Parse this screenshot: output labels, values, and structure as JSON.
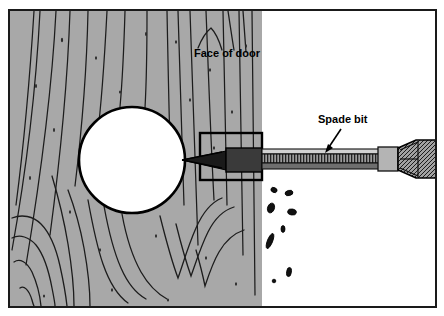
{
  "figure": {
    "domain": "technical-illustration",
    "width": 444,
    "height": 316,
    "background_color": "#ffffff",
    "border_color": "#1a1a1a"
  },
  "labels": [
    {
      "id": "face-of-door",
      "text": "Face of door",
      "x": 194,
      "y": 57,
      "anchor": "start",
      "font_size": 11,
      "bold": true,
      "color": "#000000"
    },
    {
      "id": "spade-bit",
      "text": "Spade bit",
      "x": 318,
      "y": 123,
      "anchor": "start",
      "font_size": 11,
      "bold": true,
      "color": "#000000"
    }
  ],
  "annotations": {
    "spade_bit_arrow": {
      "name": "spade-bit-leader-arrow",
      "from_x": 341,
      "from_y": 129,
      "to_x": 325,
      "to_y": 153,
      "stroke_width": 1.6,
      "color": "#000000"
    }
  },
  "colors": {
    "wood_fill": "#a8a8a8",
    "wood_grain_line": "#1a1a1a",
    "hole_fill": "#ffffff",
    "outline": "#000000",
    "bit_shaft_light": "#c9c9c9",
    "bit_shaft_mid": "#8a8a8a",
    "bit_shaft_dark": "#2b2b2b",
    "chuck_fill": "#9a9a9a",
    "chip_fill": "#111111",
    "air_background": "#ffffff"
  },
  "geometry": {
    "frame": {
      "x": 8,
      "y": 9,
      "width": 428,
      "height": 299,
      "stroke_width": 2
    },
    "wood_panel": {
      "x": 10,
      "y": 11,
      "width": 252,
      "height": 295
    },
    "door_face_edge_x": 262,
    "hole": {
      "cx": 132,
      "cy": 160,
      "r": 53
    },
    "kerf_box": {
      "x": 200,
      "y": 133,
      "width": 62,
      "height": 47
    },
    "bit_tip_apex": {
      "x": 182,
      "y": 160
    },
    "shaft": {
      "x": 262,
      "y": 149,
      "width": 135,
      "height": 20
    },
    "chuck": {
      "x": 397,
      "y": 140,
      "width": 39,
      "height": 38
    }
  },
  "chips": [
    {
      "cx": 274,
      "cy": 190,
      "rx": 3.2,
      "ry": 2.4,
      "rot": 25
    },
    {
      "cx": 288,
      "cy": 193,
      "rx": 4.0,
      "ry": 2.6,
      "rot": -15
    },
    {
      "cx": 271,
      "cy": 208,
      "rx": 3.6,
      "ry": 5.0,
      "rot": 20
    },
    {
      "cx": 292,
      "cy": 212,
      "rx": 4.4,
      "ry": 3.0,
      "rot": 10
    },
    {
      "cx": 282,
      "cy": 229,
      "rx": 2.0,
      "ry": 3.4,
      "rot": 0
    },
    {
      "cx": 270,
      "cy": 240,
      "rx": 2.6,
      "ry": 8.0,
      "rot": 22
    },
    {
      "cx": 289,
      "cy": 272,
      "rx": 2.4,
      "ry": 4.6,
      "rot": 8
    },
    {
      "cx": 274,
      "cy": 281,
      "rx": 1.8,
      "ry": 1.8,
      "rot": 0
    }
  ],
  "wood_grain_strokes": [
    "M 34 11 C 30 60, 26 120, 18 200",
    "M 52 11 C 48 70, 40 140, 22 260",
    "M 68 11 C 66 70, 60 140, 48 230",
    "M 88 11 C 86 60, 82 120, 74 185",
    "M 106 11 C 104 50, 101 100, 96 140",
    "M 124 11 C 123 45, 121 85, 119 107",
    "M 146 11 C 146 50, 145 90, 144 108",
    "M 166 11 C 167 60, 168 120, 170 175",
    "M 186 11 C 188 70, 190 140, 194 230",
    "M 204 11 C 206 60, 208 120, 212 190",
    "M 222 11 C 223 60, 224 120, 226 200",
    "M 238 11 C 239 70, 240 140, 242 250",
    "M 252 11 C 253 80, 254 160, 255 290"
  ]
}
